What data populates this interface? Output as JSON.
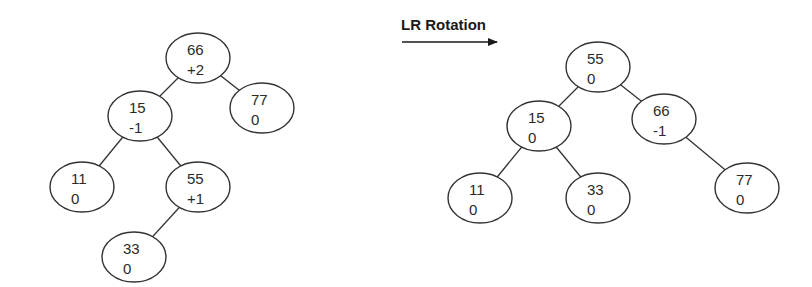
{
  "diagram": {
    "title": "LR Rotation",
    "arrow": {
      "x1": 402,
      "y1": 42,
      "x2": 497,
      "y2": 42
    },
    "node_rx": 32,
    "node_ry": 25,
    "trees": [
      {
        "name": "before",
        "nodes": [
          {
            "id": "b66",
            "key": "66",
            "balance": "+2",
            "cx": 198,
            "cy": 58
          },
          {
            "id": "b15",
            "key": "15",
            "balance": "-1",
            "cx": 140,
            "cy": 116
          },
          {
            "id": "b77",
            "key": "77",
            "balance": "0",
            "cx": 262,
            "cy": 108
          },
          {
            "id": "b11",
            "key": "11",
            "balance": "0",
            "cx": 82,
            "cy": 187
          },
          {
            "id": "b55",
            "key": "55",
            "balance": "+1",
            "cx": 198,
            "cy": 187
          },
          {
            "id": "b33",
            "key": "33",
            "balance": "0",
            "cx": 134,
            "cy": 257
          }
        ],
        "edges": [
          [
            "b66",
            "b15"
          ],
          [
            "b66",
            "b77"
          ],
          [
            "b15",
            "b11"
          ],
          [
            "b15",
            "b55"
          ],
          [
            "b55",
            "b33"
          ]
        ]
      },
      {
        "name": "after",
        "nodes": [
          {
            "id": "a55",
            "key": "55",
            "balance": "0",
            "cx": 598,
            "cy": 67
          },
          {
            "id": "a15",
            "key": "15",
            "balance": "0",
            "cx": 539,
            "cy": 126
          },
          {
            "id": "a66",
            "key": "66",
            "balance": "-1",
            "cx": 664,
            "cy": 119
          },
          {
            "id": "a11",
            "key": "11",
            "balance": "0",
            "cx": 480,
            "cy": 198
          },
          {
            "id": "a33",
            "key": "33",
            "balance": "0",
            "cx": 598,
            "cy": 198
          },
          {
            "id": "a77",
            "key": "77",
            "balance": "0",
            "cx": 747,
            "cy": 188
          }
        ],
        "edges": [
          [
            "a55",
            "a15"
          ],
          [
            "a55",
            "a66"
          ],
          [
            "a15",
            "a11"
          ],
          [
            "a15",
            "a33"
          ],
          [
            "a66",
            "a77"
          ]
        ]
      }
    ]
  }
}
